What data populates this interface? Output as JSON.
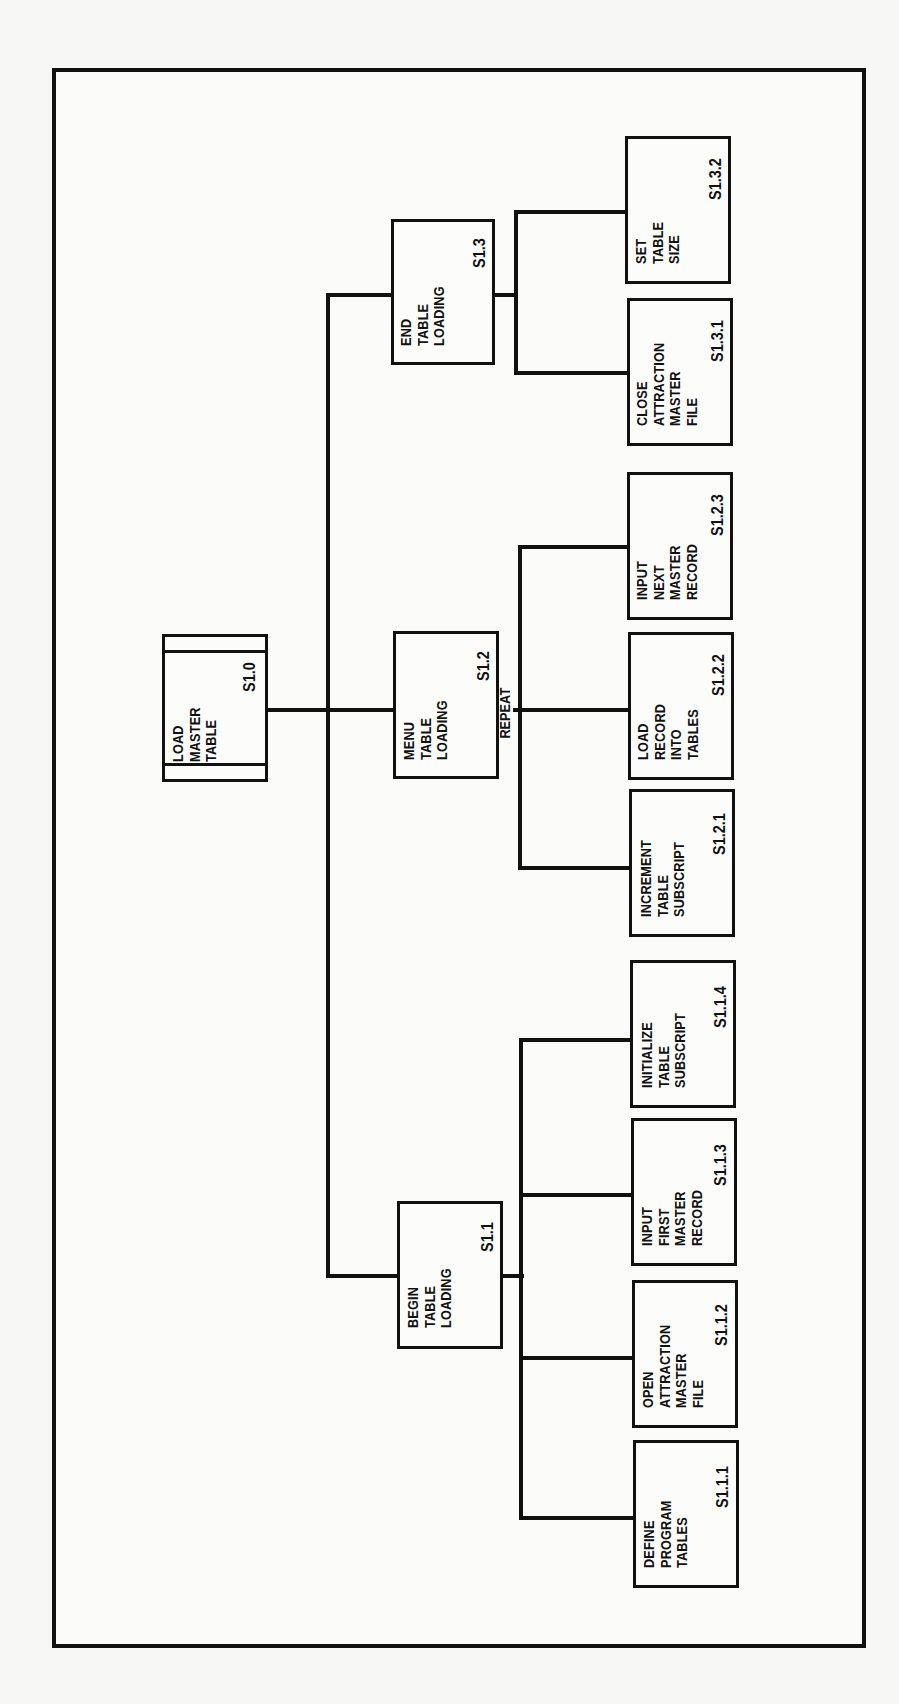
{
  "diagram": {
    "type": "structure-chart (hierarchy), rotated 90 degrees counter-clockwise",
    "root": {
      "id": "S1.0",
      "label": [
        "LOAD",
        "MASTER",
        "TABLE"
      ]
    },
    "modules": [
      {
        "id": "S1.1",
        "label": [
          "BEGIN",
          "TABLE",
          "LOADING"
        ],
        "children": [
          {
            "id": "S1.1.1",
            "label": [
              "DEFINE",
              "PROGRAM",
              "TABLES"
            ]
          },
          {
            "id": "S1.1.2",
            "label": [
              "OPEN",
              "ATTRACTION",
              "MASTER",
              "FILE"
            ]
          },
          {
            "id": "S1.1.3",
            "label": [
              "INPUT",
              "FIRST",
              "MASTER",
              "RECORD"
            ]
          },
          {
            "id": "S1.1.4",
            "label": [
              "INITIALIZE",
              "TABLE",
              "SUBSCRIPT"
            ]
          }
        ]
      },
      {
        "id": "S1.2",
        "label": [
          "MENU",
          "TABLE",
          "LOADING"
        ],
        "connector_label": "REPEAT",
        "children": [
          {
            "id": "S1.2.1",
            "label": [
              "INCREMENT",
              "TABLE",
              "SUBSCRIPT"
            ]
          },
          {
            "id": "S1.2.2",
            "label": [
              "LOAD",
              "RECORD",
              "INTO",
              "TABLES"
            ]
          },
          {
            "id": "S1.2.3",
            "label": [
              "INPUT",
              "NEXT",
              "MASTER",
              "RECORD"
            ]
          }
        ]
      },
      {
        "id": "S1.3",
        "label": [
          "END",
          "TABLE",
          "LOADING"
        ],
        "children": [
          {
            "id": "S1.3.1",
            "label": [
              "CLOSE",
              "ATTRACTION",
              "MASTER",
              "FILE"
            ]
          },
          {
            "id": "S1.3.2",
            "label": [
              "SET",
              "TABLE",
              "SIZE"
            ]
          }
        ]
      }
    ]
  },
  "colors": {
    "ink": "#111111",
    "paper": "#fbfbfa"
  }
}
